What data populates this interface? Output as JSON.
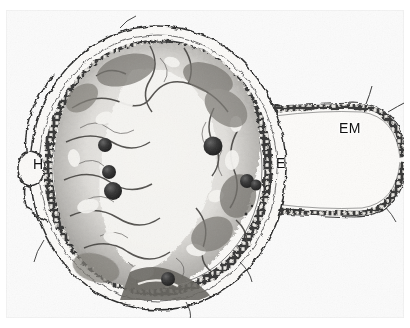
{
  "figure": {
    "kind": "light-micrograph",
    "width_px": 410,
    "height_px": 328,
    "background_color": "#ffffff",
    "plate_tint": "#fbfbfb",
    "ink_color": "#1a1a1a"
  },
  "labels": [
    {
      "id": "H",
      "text": "H",
      "meaning": "haustorium",
      "x": 33,
      "y": 164
    },
    {
      "id": "E",
      "text": "E",
      "meaning": "endosperm",
      "x": 278,
      "y": 163
    },
    {
      "id": "EM",
      "text": "EM",
      "meaning": "embryo / embryo sac",
      "x": 345,
      "y": 128
    }
  ],
  "structures": {
    "main_body": {
      "name": "seed-body",
      "shape": "ovoid",
      "center": [
        158,
        168
      ],
      "radius_x": 128,
      "radius_y": 142,
      "description": "large rounded section with dark pigmented outer cell layer, inner parenchyma network and pale central lumen"
    },
    "lateral_lobe": {
      "name": "embryo-sac-lobe",
      "shape": "tongue-shaped projection to the right",
      "left": 275,
      "top": 104,
      "width": 135,
      "height": 112,
      "description": "thin-walled elongated sac with single-layered epidermis, pale interior, truncated at the right edge of the plate"
    },
    "haustorium": {
      "name": "haustorium-vesicle",
      "shape": "small oval protrusion on the left margin",
      "center": [
        30,
        168
      ],
      "radius_x": 9,
      "radius_y": 15
    },
    "dark_bodies": [
      {
        "cx": 105,
        "cy": 145,
        "r": 7
      },
      {
        "cx": 109,
        "cy": 172,
        "r": 7
      },
      {
        "cx": 113,
        "cy": 191,
        "r": 9
      },
      {
        "cx": 213,
        "cy": 146,
        "r": 9
      },
      {
        "cx": 248,
        "cy": 181,
        "r": 7
      },
      {
        "cx": 256,
        "cy": 184,
        "r": 6
      },
      {
        "cx": 168,
        "cy": 279,
        "r": 7
      }
    ]
  }
}
